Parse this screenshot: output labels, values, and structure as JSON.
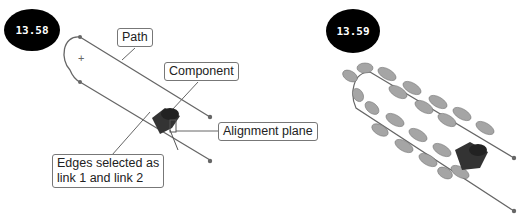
{
  "figures": [
    {
      "badge": "13.58",
      "callouts": {
        "path": "Path",
        "component": "Component",
        "alignment_plane": "Alignment plane",
        "edges_line1": "Edges selected as",
        "edges_line2": "link 1 and link 2"
      }
    },
    {
      "badge": "13.59"
    }
  ],
  "colors": {
    "path_line": "#666666",
    "badge_bg": "#000000",
    "link_gray": "#9a9a9a"
  }
}
